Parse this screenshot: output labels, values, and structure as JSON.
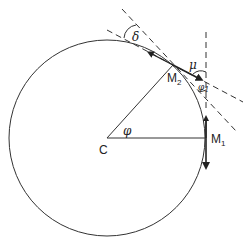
{
  "diagram": {
    "labels": {
      "center": "C",
      "point1": "M",
      "point1_sub": "1",
      "point2": "M",
      "point2_sub": "2",
      "angle_phi": "φ",
      "angle_phi1": "φ",
      "angle_phi1_sub": "1",
      "angle_mu": "μ",
      "angle_delta": "δ"
    },
    "colors": {
      "stroke": "#333333",
      "background": "#ffffff"
    },
    "geometry": {
      "circle_center": [
        107,
        138
      ],
      "circle_radius": 98,
      "M1": [
        205,
        138
      ],
      "M2": [
        173,
        65
      ]
    }
  }
}
